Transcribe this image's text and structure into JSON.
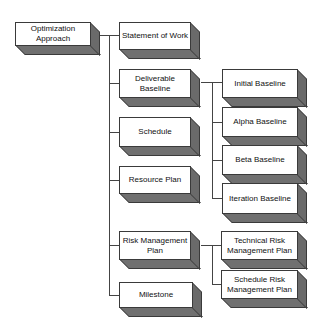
{
  "diagram": {
    "type": "hierarchy",
    "root": {
      "id": "root",
      "label": "Optimization Approach",
      "x": 15,
      "y": 22,
      "w": 75,
      "h": 24
    },
    "level1": [
      {
        "id": "sow",
        "label": "Statement of Work",
        "x": 119,
        "y": 22,
        "w": 72,
        "h": 28
      },
      {
        "id": "deliverable",
        "label": "Deliverable Baseline",
        "x": 119,
        "y": 69,
        "w": 72,
        "h": 29
      },
      {
        "id": "schedule",
        "label": "Schedule",
        "x": 119,
        "y": 117,
        "w": 72,
        "h": 30
      },
      {
        "id": "resource",
        "label": "Resource Plan",
        "x": 119,
        "y": 166,
        "w": 72,
        "h": 28
      },
      {
        "id": "risk",
        "label": "Risk Management Plan",
        "x": 119,
        "y": 231,
        "w": 72,
        "h": 29
      },
      {
        "id": "milestone",
        "label": "Milestone",
        "x": 119,
        "y": 282,
        "w": 74,
        "h": 26
      }
    ],
    "level2_deliverable": [
      {
        "id": "initial",
        "label": "Initial Baseline",
        "x": 222,
        "y": 69,
        "w": 76,
        "h": 29
      },
      {
        "id": "alpha",
        "label": "Alpha Baseline",
        "x": 222,
        "y": 107,
        "w": 76,
        "h": 30
      },
      {
        "id": "beta",
        "label": "Beta Baseline",
        "x": 222,
        "y": 145,
        "w": 76,
        "h": 30
      },
      {
        "id": "iteration",
        "label": "Iteration Baseline",
        "x": 222,
        "y": 183,
        "w": 76,
        "h": 31
      }
    ],
    "level2_risk": [
      {
        "id": "techrisk",
        "label": "Technical Risk Management Plan",
        "x": 221,
        "y": 231,
        "w": 77,
        "h": 29
      },
      {
        "id": "schedrisk",
        "label": "Schedule Risk Management Plan",
        "x": 221,
        "y": 270,
        "w": 77,
        "h": 29
      }
    ],
    "colors": {
      "face": "#ffffff",
      "shade": "#6e6e6e",
      "line": "#444444",
      "text": "#111111"
    }
  }
}
